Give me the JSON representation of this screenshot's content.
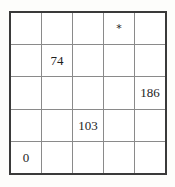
{
  "grid": {
    "rows": 5,
    "columns": 5,
    "outer_border_color": "#3a3a3a",
    "inner_line_color": "#8a8a8a",
    "cell_background": "#ffffff",
    "page_background": "#fdfdfb",
    "text_color": "#1d1d1d",
    "cells": [
      [
        {
          "value": "",
          "kind": "empty"
        },
        {
          "value": "",
          "kind": "empty"
        },
        {
          "value": "",
          "kind": "empty"
        },
        {
          "value": "*",
          "kind": "marker"
        },
        {
          "value": "",
          "kind": "empty"
        }
      ],
      [
        {
          "value": "",
          "kind": "empty"
        },
        {
          "value": "74",
          "kind": "number"
        },
        {
          "value": "",
          "kind": "empty"
        },
        {
          "value": "",
          "kind": "empty"
        },
        {
          "value": "",
          "kind": "empty"
        }
      ],
      [
        {
          "value": "",
          "kind": "empty"
        },
        {
          "value": "",
          "kind": "empty"
        },
        {
          "value": "",
          "kind": "empty"
        },
        {
          "value": "",
          "kind": "empty"
        },
        {
          "value": "186",
          "kind": "number"
        }
      ],
      [
        {
          "value": "",
          "kind": "empty"
        },
        {
          "value": "",
          "kind": "empty"
        },
        {
          "value": "103",
          "kind": "number"
        },
        {
          "value": "",
          "kind": "empty"
        },
        {
          "value": "",
          "kind": "empty"
        }
      ],
      [
        {
          "value": "0",
          "kind": "number"
        },
        {
          "value": "",
          "kind": "empty"
        },
        {
          "value": "",
          "kind": "empty"
        },
        {
          "value": "",
          "kind": "empty"
        },
        {
          "value": "",
          "kind": "empty"
        }
      ]
    ]
  }
}
